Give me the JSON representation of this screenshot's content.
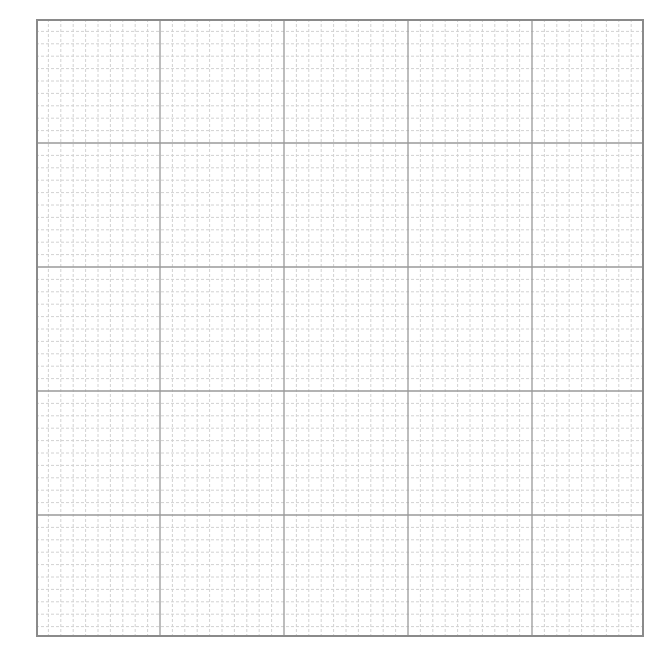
{
  "graph_paper": {
    "origin": {
      "x": 36,
      "y": 19
    },
    "width": 608,
    "height": 618,
    "major_spacing": 124,
    "minor_divisions": 10,
    "colors": {
      "background": "#ffffff",
      "border": "#8a8a8a",
      "major": "#9a9a9a",
      "minor": "#d2d2d2"
    }
  }
}
